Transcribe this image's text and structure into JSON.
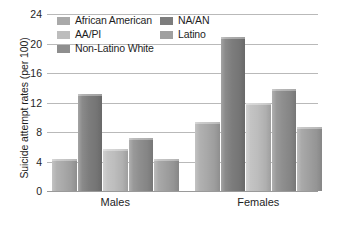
{
  "chart_data": {
    "type": "bar",
    "title": "",
    "xlabel": "",
    "ylabel": "Suicide attempt rates (per 100)",
    "categories": [
      "Males",
      "Females"
    ],
    "ylim": [
      0,
      24
    ],
    "yticks": [
      0,
      4,
      8,
      12,
      16,
      20,
      24
    ],
    "ytick_labels": [
      "0",
      "4",
      "8",
      "12",
      "16",
      "20",
      "24"
    ],
    "grid": true,
    "legend_position": "top-left-inside",
    "series": [
      {
        "name": "African American",
        "color": "#a9a9a9",
        "values": [
          4.4,
          9.4
        ]
      },
      {
        "name": "NA/AN",
        "color": "#7d7d7d",
        "values": [
          13.2,
          20.9
        ]
      },
      {
        "name": "AA/PI",
        "color": "#bdbdbd",
        "values": [
          5.7,
          11.9
        ]
      },
      {
        "name": "Non-Latino White",
        "color": "#8e8e8e",
        "values": [
          7.2,
          13.9
        ]
      },
      {
        "name": "Latino",
        "color": "#a0a0a0",
        "values": [
          4.4,
          8.7
        ]
      }
    ]
  },
  "legend": {
    "items": [
      {
        "label": "African American",
        "color": "#a9a9a9"
      },
      {
        "label": "AA/PI",
        "color": "#bdbdbd"
      },
      {
        "label": "Non-Latino White",
        "color": "#8e8e8e"
      },
      {
        "label": "NA/AN",
        "color": "#7d7d7d"
      },
      {
        "label": "Latino",
        "color": "#a0a0a0"
      }
    ]
  },
  "axis": {
    "y_title": "Suicide attempt rates (per 100)",
    "tick_labels": [
      "24",
      "20",
      "16",
      "12",
      "8",
      "4",
      "0"
    ],
    "category_labels": [
      "Males",
      "Females"
    ]
  },
  "colors": {
    "gridline": "#b9b9b9",
    "baseline": "#9a9a9a",
    "text": "#1e1e1e",
    "background": "#ffffff"
  }
}
